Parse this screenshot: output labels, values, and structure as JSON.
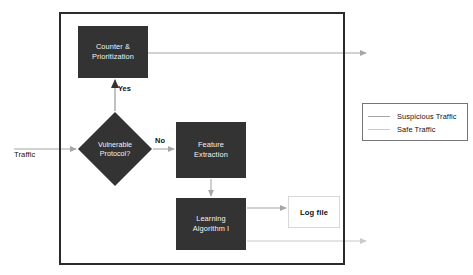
{
  "diagram": {
    "input": {
      "label": "Traffic"
    },
    "system_boundary": {
      "name": "system-boundary"
    },
    "nodes": [
      {
        "id": "counter",
        "label": "Counter &\nPrioritization",
        "shape": "rectangle",
        "fill": "#333333",
        "text_color": "#f2f2f2"
      },
      {
        "id": "decision",
        "label": "Vulnerable\nProtocol?",
        "shape": "diamond",
        "fill": "#333333",
        "text_color": "#f2f2f2"
      },
      {
        "id": "feature",
        "label": "Feature\nExtraction",
        "shape": "rectangle",
        "fill": "#333333",
        "text_color": "#f2f2f2"
      },
      {
        "id": "learning",
        "label": "Learning\nAlgorithm I",
        "shape": "rectangle",
        "fill": "#333333",
        "text_color": "#f2f2f2"
      },
      {
        "id": "logfile",
        "label": "Log file",
        "shape": "rectangle",
        "fill": "#ffffff",
        "text_color": "#111111"
      }
    ],
    "edge_labels": {
      "yes": "Yes",
      "no": "No"
    },
    "legend": {
      "items": [
        {
          "label": "Suspicious Traffic",
          "color": "#a6a6a6"
        },
        {
          "label": "Safe Traffic",
          "color": "#c9c9c9"
        }
      ]
    },
    "colors": {
      "box_fill": "#333333",
      "border": "#2b2b2b",
      "connector": "#a6a6a6",
      "connector_light": "#c9c9c9",
      "label_text": "#111111"
    }
  }
}
